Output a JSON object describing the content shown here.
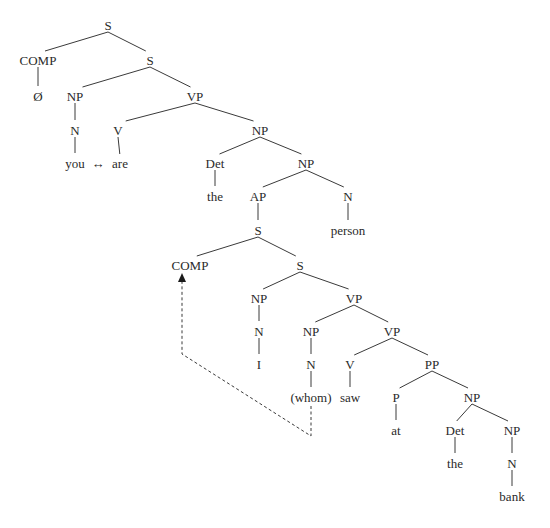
{
  "diagram": {
    "type": "syntax-tree",
    "sentence": "you ↔ are the I (whom) saw at the bank person",
    "colors": {
      "text": "#2a2a2a",
      "lines": "#3a3a3a",
      "background": "#ffffff"
    },
    "nodes": [
      {
        "id": "s_root",
        "label": "S",
        "x": 108,
        "y": 25
      },
      {
        "id": "comp1",
        "label": "COMP",
        "x": 38,
        "y": 60
      },
      {
        "id": "null",
        "label": "Ø",
        "x": 38,
        "y": 96
      },
      {
        "id": "s2",
        "label": "S",
        "x": 150,
        "y": 60
      },
      {
        "id": "np1",
        "label": "NP",
        "x": 75,
        "y": 96
      },
      {
        "id": "n1",
        "label": "N",
        "x": 75,
        "y": 130
      },
      {
        "id": "you",
        "label": "you",
        "x": 75,
        "y": 163
      },
      {
        "id": "arrow",
        "label": "↔",
        "x": 98,
        "y": 163
      },
      {
        "id": "vp1",
        "label": "VP",
        "x": 195,
        "y": 96
      },
      {
        "id": "v1",
        "label": "V",
        "x": 118,
        "y": 130
      },
      {
        "id": "are",
        "label": "are",
        "x": 120,
        "y": 163
      },
      {
        "id": "np2",
        "label": "NP",
        "x": 260,
        "y": 130
      },
      {
        "id": "det1",
        "label": "Det",
        "x": 215,
        "y": 163
      },
      {
        "id": "the1",
        "label": "the",
        "x": 215,
        "y": 196
      },
      {
        "id": "np3",
        "label": "NP",
        "x": 306,
        "y": 163
      },
      {
        "id": "ap",
        "label": "AP",
        "x": 258,
        "y": 196
      },
      {
        "id": "s3",
        "label": "S",
        "x": 258,
        "y": 230
      },
      {
        "id": "n2",
        "label": "N",
        "x": 348,
        "y": 196
      },
      {
        "id": "person",
        "label": "person",
        "x": 348,
        "y": 230
      },
      {
        "id": "comp2",
        "label": "COMP",
        "x": 190,
        "y": 265
      },
      {
        "id": "s4",
        "label": "S",
        "x": 300,
        "y": 265
      },
      {
        "id": "np4",
        "label": "NP",
        "x": 259,
        "y": 298
      },
      {
        "id": "n3",
        "label": "N",
        "x": 259,
        "y": 331
      },
      {
        "id": "i",
        "label": "I",
        "x": 259,
        "y": 364
      },
      {
        "id": "vp2",
        "label": "VP",
        "x": 354,
        "y": 298
      },
      {
        "id": "np5",
        "label": "NP",
        "x": 311,
        "y": 331
      },
      {
        "id": "n4",
        "label": "N",
        "x": 311,
        "y": 364
      },
      {
        "id": "whom",
        "label": "(whom)",
        "x": 311,
        "y": 397
      },
      {
        "id": "vp3",
        "label": "VP",
        "x": 392,
        "y": 331
      },
      {
        "id": "v2",
        "label": "V",
        "x": 350,
        "y": 364
      },
      {
        "id": "saw",
        "label": "saw",
        "x": 350,
        "y": 397
      },
      {
        "id": "pp",
        "label": "PP",
        "x": 432,
        "y": 364
      },
      {
        "id": "p",
        "label": "P",
        "x": 396,
        "y": 397
      },
      {
        "id": "at",
        "label": "at",
        "x": 396,
        "y": 430
      },
      {
        "id": "np6",
        "label": "NP",
        "x": 472,
        "y": 397
      },
      {
        "id": "det2",
        "label": "Det",
        "x": 455,
        "y": 430
      },
      {
        "id": "the2",
        "label": "the",
        "x": 455,
        "y": 463
      },
      {
        "id": "np7",
        "label": "NP",
        "x": 512,
        "y": 430
      },
      {
        "id": "n5",
        "label": "N",
        "x": 512,
        "y": 463
      },
      {
        "id": "bank",
        "label": "bank",
        "x": 512,
        "y": 496
      }
    ],
    "edges": [
      [
        "s_root",
        "comp1"
      ],
      [
        "s_root",
        "s2"
      ],
      [
        "comp1",
        "null"
      ],
      [
        "s2",
        "np1"
      ],
      [
        "s2",
        "vp1"
      ],
      [
        "np1",
        "n1"
      ],
      [
        "n1",
        "you"
      ],
      [
        "vp1",
        "v1"
      ],
      [
        "vp1",
        "np2"
      ],
      [
        "v1",
        "are"
      ],
      [
        "np2",
        "det1"
      ],
      [
        "np2",
        "np3"
      ],
      [
        "det1",
        "the1"
      ],
      [
        "np3",
        "ap"
      ],
      [
        "np3",
        "n2"
      ],
      [
        "ap",
        "s3"
      ],
      [
        "n2",
        "person"
      ],
      [
        "s3",
        "comp2"
      ],
      [
        "s3",
        "s4"
      ],
      [
        "s4",
        "np4"
      ],
      [
        "s4",
        "vp2"
      ],
      [
        "np4",
        "n3"
      ],
      [
        "n3",
        "i"
      ],
      [
        "vp2",
        "np5"
      ],
      [
        "vp2",
        "vp3"
      ],
      [
        "np5",
        "n4"
      ],
      [
        "n4",
        "whom"
      ],
      [
        "vp3",
        "v2"
      ],
      [
        "vp3",
        "pp"
      ],
      [
        "v2",
        "saw"
      ],
      [
        "pp",
        "p"
      ],
      [
        "pp",
        "np6"
      ],
      [
        "p",
        "at"
      ],
      [
        "np6",
        "det2"
      ],
      [
        "np6",
        "np7"
      ],
      [
        "det2",
        "the2"
      ],
      [
        "np7",
        "n5"
      ],
      [
        "n5",
        "bank"
      ]
    ],
    "movement_arrow": {
      "from": "whom",
      "to": "comp2",
      "style": "dashed",
      "points": [
        [
          311,
          406
        ],
        [
          311,
          436
        ],
        [
          182,
          354
        ],
        [
          182,
          278
        ]
      ]
    }
  }
}
